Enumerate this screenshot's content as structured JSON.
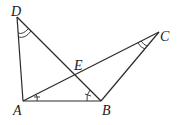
{
  "diagram": {
    "type": "geometry",
    "points": {
      "A": {
        "label": "A",
        "x": 23,
        "y": 101
      },
      "B": {
        "label": "B",
        "x": 101,
        "y": 101
      },
      "C": {
        "label": "C",
        "x": 159,
        "y": 32
      },
      "D": {
        "label": "D",
        "x": 17,
        "y": 17
      },
      "E": {
        "label": "E",
        "x": 76,
        "y": 74
      }
    },
    "segments": [
      "AD",
      "AB",
      "BD",
      "AC",
      "BC"
    ],
    "angle_marks": [
      {
        "vertex": "D",
        "between": [
          "A",
          "B"
        ],
        "style": "double-arc"
      },
      {
        "vertex": "C",
        "between": [
          "A",
          "B"
        ],
        "style": "double-arc"
      },
      {
        "vertex": "A",
        "between": [
          "B",
          "C"
        ],
        "style": "single-tick"
      },
      {
        "vertex": "B",
        "between": [
          "A",
          "D"
        ],
        "style": "single-tick"
      }
    ],
    "colors": {
      "stroke": "#2a2a2a",
      "background": "#ffffff"
    }
  }
}
